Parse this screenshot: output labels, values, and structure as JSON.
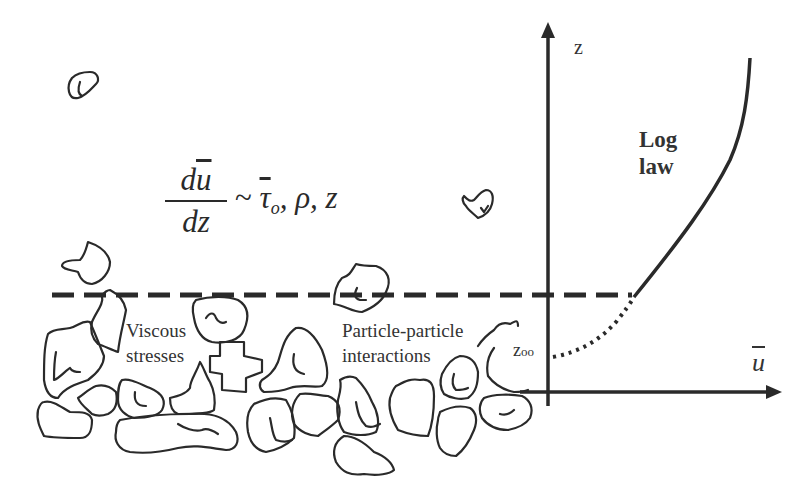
{
  "diagram": {
    "type": "boundary-layer velocity profile over rough granular bed",
    "equation": {
      "numerator": "du",
      "numerator_d": "d",
      "numerator_u": "u",
      "denominator": "dz",
      "relation": "~",
      "tau": "τ",
      "tau_sub": "o",
      "rest": ", ρ, z"
    },
    "axes": {
      "vertical_label": "z",
      "horizontal_label": "u",
      "origin_offset_label": "z",
      "origin_offset_sub": "oo"
    },
    "curve_label_line1": "Log",
    "curve_label_line2": "law",
    "region_labels": {
      "viscous_line1": "Viscous",
      "viscous_line2": "stresses",
      "particle_line1": "Particle-particle",
      "particle_line2": "interactions"
    },
    "colors": {
      "ink": "#2a2a2a",
      "background": "#ffffff"
    }
  }
}
